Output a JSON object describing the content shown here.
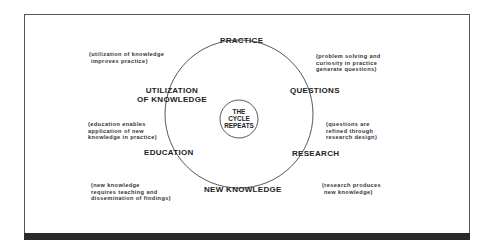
{
  "diagram": {
    "center": {
      "lines": [
        "THE",
        "CYCLE",
        "REPEATS"
      ]
    },
    "stages": {
      "practice": "PRACTICE",
      "questions": "QUESTIONS",
      "research": "RESEARCH",
      "new_knowledge": "NEW KNOWLEDGE",
      "education": "EDUCATION",
      "utilization_line1": "UTILIZATION",
      "utilization_line2": "OF KNOWLEDGE"
    },
    "notes": {
      "utilization_to_practice": "(utilization of knowledge\n improves practice)",
      "practice_to_questions": "(problem solving and\ncuriosity in practice\ngenerate questions)",
      "questions_to_research": "(questions are\nrefined through\nresearch design)",
      "research_to_knowledge": "(research produces\n new knowledge)",
      "knowledge_to_education": "(new knowledge\nrequires teaching and\ndissemination of findings)",
      "education_to_utilization": "(education enables\napplication of new\nknowledge in practice)"
    }
  }
}
